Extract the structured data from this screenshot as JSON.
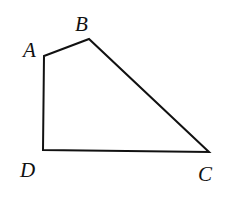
{
  "diagram": {
    "type": "quadrilateral",
    "stroke_color": "#111111",
    "vertices": [
      {
        "name": "A",
        "x": 44,
        "y": 56,
        "label_x": 23,
        "label_y": 57
      },
      {
        "name": "B",
        "x": 89,
        "y": 39,
        "label_x": 75,
        "label_y": 31
      },
      {
        "name": "C",
        "x": 209,
        "y": 152,
        "label_x": 198,
        "label_y": 181
      },
      {
        "name": "D",
        "x": 43,
        "y": 150,
        "label_x": 20,
        "label_y": 177
      }
    ],
    "labels": {
      "A": "A",
      "B": "B",
      "C": "C",
      "D": "D"
    }
  }
}
